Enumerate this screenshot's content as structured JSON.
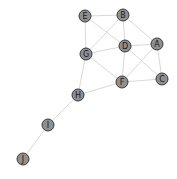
{
  "graph": {
    "type": "undirected-network",
    "node_color": "#8f8f8f",
    "node_border_color": "#3a3a3a",
    "edge_color": "#d9d9d9",
    "node_radius": 6,
    "nodes": [
      {
        "id": "A",
        "label": "A",
        "x": 157,
        "y": 44
      },
      {
        "id": "B",
        "label": "B",
        "x": 123,
        "y": 15
      },
      {
        "id": "C",
        "label": "C",
        "x": 162,
        "y": 79
      },
      {
        "id": "D",
        "label": "D",
        "x": 125,
        "y": 46
      },
      {
        "id": "E",
        "label": "E",
        "x": 85,
        "y": 16
      },
      {
        "id": "F",
        "label": "F",
        "x": 122,
        "y": 82
      },
      {
        "id": "G",
        "label": "G",
        "x": 86,
        "y": 54
      },
      {
        "id": "H",
        "label": "H",
        "x": 78,
        "y": 95
      },
      {
        "id": "I",
        "label": "I",
        "x": 48,
        "y": 125
      },
      {
        "id": "J",
        "label": "J",
        "x": 23,
        "y": 159
      }
    ],
    "edges": [
      [
        "E",
        "B"
      ],
      [
        "E",
        "G"
      ],
      [
        "E",
        "D"
      ],
      [
        "B",
        "G"
      ],
      [
        "B",
        "D"
      ],
      [
        "B",
        "A"
      ],
      [
        "D",
        "A"
      ],
      [
        "D",
        "G"
      ],
      [
        "D",
        "F"
      ],
      [
        "D",
        "C"
      ],
      [
        "A",
        "F"
      ],
      [
        "A",
        "C"
      ],
      [
        "G",
        "F"
      ],
      [
        "G",
        "H"
      ],
      [
        "F",
        "C"
      ],
      [
        "F",
        "H"
      ],
      [
        "H",
        "I"
      ],
      [
        "I",
        "J"
      ]
    ]
  }
}
